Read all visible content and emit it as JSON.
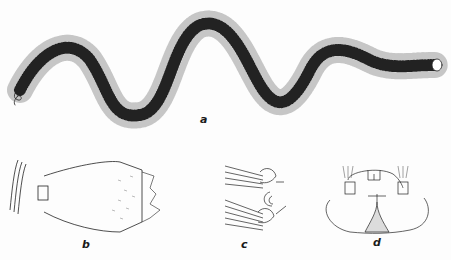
{
  "figure": {
    "panels": [
      {
        "id": "a",
        "label": "a",
        "description": "whole polychaete worm, sinuous body with parapodia and setae"
      },
      {
        "id": "b",
        "label": "b",
        "description": "everted proboscis, lateral view"
      },
      {
        "id": "c",
        "label": "c",
        "description": "parapodium detail"
      },
      {
        "id": "d",
        "label": "d",
        "description": "anterior end / head, dorsal view"
      }
    ],
    "colors": {
      "ink": "#1a1a1a",
      "background": "#fdfdfd",
      "stipple": "#d8d8d8"
    }
  }
}
